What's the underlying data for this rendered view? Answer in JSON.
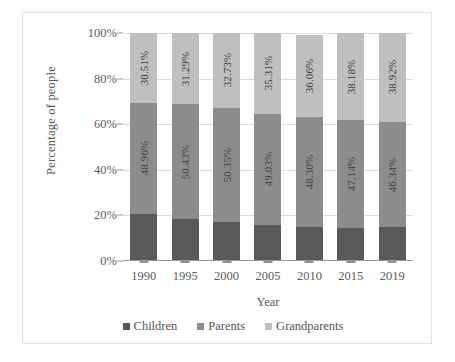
{
  "chart_data": {
    "type": "bar",
    "subtype": "100% stacked bar",
    "title": "",
    "xlabel": "Year",
    "ylabel": "Percentage of people",
    "categories": [
      "1990",
      "1995",
      "2000",
      "2005",
      "2010",
      "2015",
      "2019"
    ],
    "ylim": [
      0,
      100
    ],
    "yticks": [
      "0%",
      "20%",
      "40%",
      "60%",
      "80%",
      "100%"
    ],
    "ytick_values": [
      0,
      20,
      40,
      60,
      80,
      100
    ],
    "grid": true,
    "legend_position": "bottom",
    "series": [
      {
        "name": "Children",
        "color": "#595959",
        "values": [
          20.53,
          18.28,
          16.92,
          15.66,
          14.98,
          14.68,
          14.74
        ],
        "labels": [
          "20.53%",
          "18.28%",
          "16.92%",
          "15.66%",
          "14.98%",
          "14.68%",
          "14.74%"
        ],
        "labels_visible": false
      },
      {
        "name": "Parents",
        "color": "#8c8c8c",
        "values": [
          48.96,
          50.43,
          50.35,
          49.03,
          48.3,
          47.14,
          46.34
        ],
        "labels": [
          "48.96%",
          "50.43%",
          "50.35%",
          "49.03%",
          "48.30%",
          "47.14%",
          "46.34%"
        ],
        "labels_visible": true
      },
      {
        "name": "Grandparents",
        "color": "#bfbfbf",
        "values": [
          30.51,
          31.29,
          32.73,
          35.31,
          36.06,
          38.18,
          38.92
        ],
        "labels": [
          "30.51%",
          "31.29%",
          "32.73%",
          "35.31%",
          "36.06%",
          "38.18%",
          "38.92%"
        ],
        "labels_visible": true
      }
    ]
  },
  "axes": {
    "y_title": "Percentage of people",
    "x_title": "Year"
  },
  "legend": {
    "items": [
      {
        "label": "Children",
        "color": "#595959"
      },
      {
        "label": "Parents",
        "color": "#8c8c8c"
      },
      {
        "label": "Grandparents",
        "color": "#bfbfbf"
      }
    ]
  },
  "colors": {
    "children": "#595959",
    "parents": "#8c8c8c",
    "grandparents": "#bfbfbf",
    "gridline": "#dcdcdc",
    "axis": "#9a9a9a",
    "text": "#5d5d5d",
    "frame_border": "#e2e2e2",
    "background": "#fefefe"
  }
}
